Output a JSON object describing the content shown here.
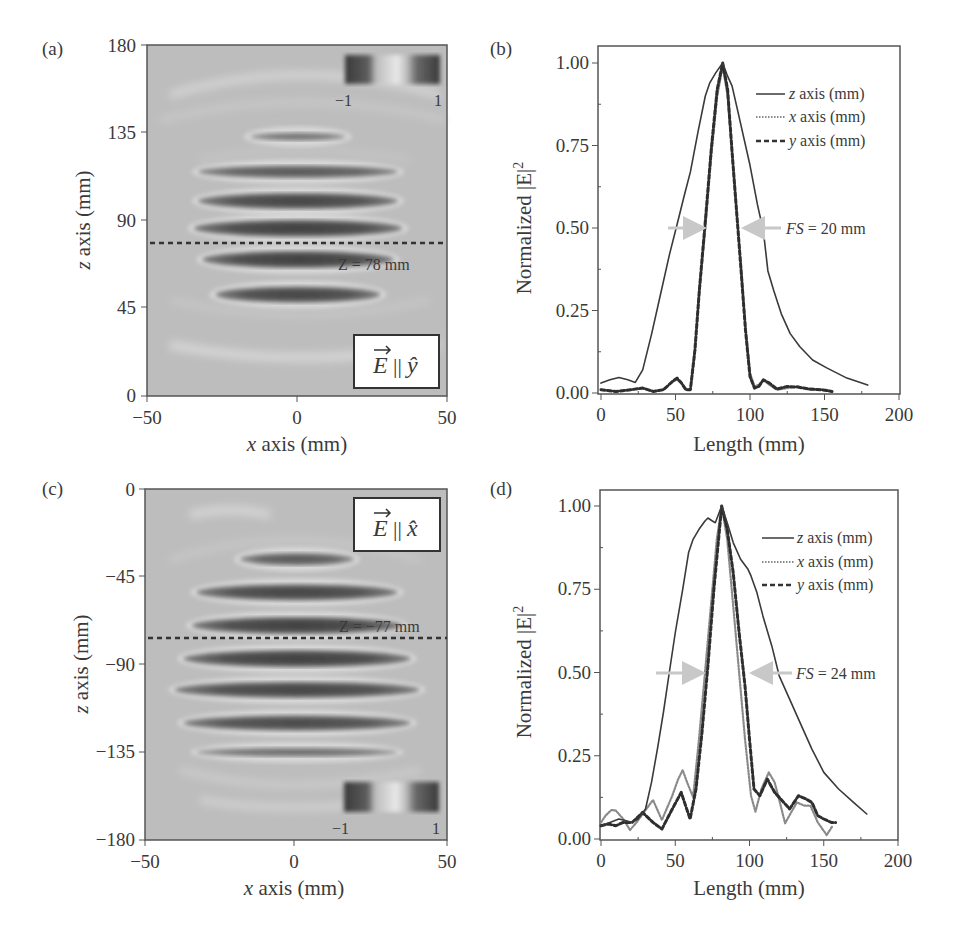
{
  "figure": {
    "panels": {
      "a": {
        "tag": "(a)",
        "xlabel_var": "x",
        "xlabel_rest": " axis (mm)",
        "ylabel_var": "z",
        "ylabel_rest": " axis (mm)",
        "xticks": [
          "−50",
          "0",
          "50"
        ],
        "yticks": [
          "0",
          "45",
          "90",
          "135",
          "180"
        ],
        "colorbar": {
          "min_label": "−1",
          "max_label": "1"
        },
        "cut_label": "Z = 78 mm",
        "polarization_label": {
          "vector": "E",
          "sep": "||",
          "unit": "ŷ"
        }
      },
      "b": {
        "tag": "(b)",
        "xlabel": "Length (mm)",
        "ylabel": "Normalized |E|",
        "ylabel_sup": "2",
        "xticks": [
          "0",
          "50",
          "100",
          "150",
          "200"
        ],
        "yticks": [
          "0.00",
          "0.25",
          "0.50",
          "0.75",
          "1.00"
        ],
        "legend": [
          {
            "var": "z",
            "rest": " axis (mm)",
            "style": "solid"
          },
          {
            "var": "x",
            "rest": " axis (mm)",
            "style": "dotted"
          },
          {
            "var": "y",
            "rest": " axis (mm)",
            "style": "dashed"
          }
        ],
        "fs_label_var": "FS",
        "fs_label_rest": " = 20 mm"
      },
      "c": {
        "tag": "(c)",
        "xlabel_var": "x",
        "xlabel_rest": " axis (mm)",
        "ylabel_var": "z",
        "ylabel_rest": " axis (mm)",
        "xticks": [
          "−50",
          "0",
          "50"
        ],
        "yticks": [
          "−180",
          "−135",
          "−90",
          "−45",
          "0"
        ],
        "colorbar": {
          "min_label": "−1",
          "max_label": "1"
        },
        "cut_label": "Z = −77 mm",
        "polarization_label": {
          "vector": "E",
          "sep": "||",
          "unit": "x̂"
        }
      },
      "d": {
        "tag": "(d)",
        "xlabel": "Length (mm)",
        "ylabel": "Normalized |E|",
        "ylabel_sup": "2",
        "xticks": [
          "0",
          "50",
          "100",
          "150",
          "200"
        ],
        "yticks": [
          "0.00",
          "0.25",
          "0.50",
          "0.75",
          "1.00"
        ],
        "legend": [
          {
            "var": "z",
            "rest": " axis (mm)",
            "style": "solid"
          },
          {
            "var": "x",
            "rest": " axis (mm)",
            "style": "dotted"
          },
          {
            "var": "y",
            "rest": " axis (mm)",
            "style": "dashed"
          }
        ],
        "fs_label_var": "FS",
        "fs_label_rest": " = 24 mm"
      }
    },
    "colors": {
      "line": "#3a3a3a",
      "dotted": "#8a8a8a",
      "arrow": "#c8c8c8",
      "field_bg": "#bdbdbd",
      "frame": "#555555"
    }
  },
  "chart_data": [
    {
      "panel": "a",
      "type": "heatmap",
      "title": "",
      "xlabel": "x axis (mm)",
      "ylabel": "z axis (mm)",
      "xlim": [
        -50,
        50
      ],
      "ylim": [
        0,
        180
      ],
      "xticks": [
        -50,
        0,
        50
      ],
      "yticks": [
        0,
        45,
        90,
        135,
        180
      ],
      "colorbar_range": [
        -1,
        1
      ],
      "annotation": "Z = 78 mm (dashed cut line)",
      "cut_z": 78,
      "polarization": "E || y-hat",
      "lobes": [
        {
          "z": 133,
          "width_mm": 11,
          "intensity": 0.45
        },
        {
          "z": 115,
          "width_mm": 23,
          "intensity": 0.7
        },
        {
          "z": 100,
          "width_mm": 23,
          "intensity": 0.9
        },
        {
          "z": 86,
          "width_mm": 24,
          "intensity": 0.95
        },
        {
          "z": 70,
          "width_mm": 22,
          "intensity": 0.95
        },
        {
          "z": 52,
          "width_mm": 19,
          "intensity": 0.9
        }
      ]
    },
    {
      "panel": "b",
      "type": "line",
      "title": "",
      "xlabel": "Length (mm)",
      "ylabel": "Normalized |E|^2",
      "xlim": [
        0,
        200
      ],
      "ylim": [
        0,
        1.05
      ],
      "xticks": [
        0,
        50,
        100,
        150,
        200
      ],
      "yticks": [
        0,
        0.25,
        0.5,
        0.75,
        1.0
      ],
      "legend_position": "upper right",
      "annotation": "FS = 20 mm",
      "arrows_y": 0.5,
      "series": [
        {
          "name": "z axis (mm)",
          "style": "solid",
          "x": [
            0,
            6,
            12,
            18,
            23,
            28,
            34,
            40,
            46,
            51,
            56,
            60,
            65,
            70,
            73,
            77,
            81.7,
            85,
            88,
            93,
            100,
            105,
            109,
            112,
            116,
            121,
            127,
            133.5,
            142,
            151.5,
            165,
            179
          ],
          "y": [
            0.03,
            0.04,
            0.047,
            0.04,
            0.032,
            0.07,
            0.18,
            0.3,
            0.42,
            0.51,
            0.6,
            0.67,
            0.79,
            0.9,
            0.94,
            0.97,
            1.0,
            0.96,
            0.93,
            0.83,
            0.69,
            0.57,
            0.49,
            0.37,
            0.31,
            0.24,
            0.18,
            0.14,
            0.1,
            0.076,
            0.045,
            0.024
          ]
        },
        {
          "name": "x axis (mm)",
          "style": "dotted",
          "x": [
            0,
            10,
            20,
            28,
            35,
            42,
            48,
            51,
            54,
            57,
            60,
            63,
            66,
            70,
            74,
            78,
            81.7,
            85,
            88,
            91,
            94,
            97,
            100,
            103,
            106,
            109,
            113,
            118,
            125,
            132,
            140,
            148,
            155
          ],
          "y": [
            0.01,
            0.005,
            0.01,
            0.015,
            0.005,
            0.01,
            0.035,
            0.04,
            0.03,
            0.01,
            0.01,
            0.12,
            0.3,
            0.5,
            0.72,
            0.9,
            0.99,
            0.9,
            0.72,
            0.55,
            0.38,
            0.2,
            0.06,
            0.02,
            0.025,
            0.04,
            0.025,
            0.01,
            0.015,
            0.02,
            0.01,
            0.01,
            0.005
          ]
        },
        {
          "name": "y axis (mm)",
          "style": "dashed",
          "x": [
            0,
            10,
            20,
            28,
            35,
            42,
            48,
            51,
            54,
            57,
            60,
            63,
            66,
            70,
            74,
            78,
            81.7,
            85,
            88,
            91,
            94,
            97,
            100,
            103,
            106,
            109,
            113,
            118,
            125,
            132,
            140,
            148,
            155
          ],
          "y": [
            0.01,
            0.005,
            0.01,
            0.015,
            0.005,
            0.01,
            0.035,
            0.045,
            0.03,
            0.01,
            0.01,
            0.13,
            0.31,
            0.52,
            0.74,
            0.92,
            1.0,
            0.92,
            0.73,
            0.55,
            0.37,
            0.19,
            0.05,
            0.015,
            0.02,
            0.04,
            0.03,
            0.012,
            0.02,
            0.018,
            0.012,
            0.01,
            0.005
          ]
        }
      ]
    },
    {
      "panel": "c",
      "type": "heatmap",
      "title": "",
      "xlabel": "x axis (mm)",
      "ylabel": "z axis (mm)",
      "xlim": [
        -50,
        50
      ],
      "ylim": [
        -180,
        0
      ],
      "xticks": [
        -50,
        0,
        50
      ],
      "yticks": [
        -180,
        -135,
        -90,
        -45,
        0
      ],
      "colorbar_range": [
        -1,
        1
      ],
      "annotation": "Z = -77 mm (dashed cut line)",
      "cut_z": -77,
      "polarization": "E || x-hat",
      "lobes": [
        {
          "z": -36,
          "width_mm": 13,
          "intensity": 0.7
        },
        {
          "z": -53,
          "width_mm": 23,
          "intensity": 0.9
        },
        {
          "z": -70,
          "width_mm": 24,
          "intensity": 0.95
        },
        {
          "z": -87,
          "width_mm": 26,
          "intensity": 0.95
        },
        {
          "z": -103,
          "width_mm": 28,
          "intensity": 0.9
        },
        {
          "z": -120,
          "width_mm": 26,
          "intensity": 0.85
        },
        {
          "z": -135,
          "width_mm": 23,
          "intensity": 0.5
        }
      ]
    },
    {
      "panel": "d",
      "type": "line",
      "title": "",
      "xlabel": "Length (mm)",
      "ylabel": "Normalized |E|^2",
      "xlim": [
        0,
        200
      ],
      "ylim": [
        0,
        1.05
      ],
      "xticks": [
        0,
        50,
        100,
        150,
        200
      ],
      "yticks": [
        0,
        0.25,
        0.5,
        0.75,
        1.0
      ],
      "legend_position": "upper right",
      "annotation": "FS = 24 mm",
      "arrows_y": 0.5,
      "series": [
        {
          "name": "z axis (mm)",
          "style": "solid",
          "x": [
            0,
            6,
            12,
            17,
            21,
            25,
            30,
            34,
            38,
            42,
            46,
            50,
            55,
            59,
            62,
            66,
            70,
            72,
            75,
            77,
            81.3,
            85,
            89,
            94,
            99,
            101,
            105,
            109,
            115,
            120,
            127,
            135,
            142,
            150,
            160,
            170,
            179
          ],
          "y": [
            0.04,
            0.05,
            0.06,
            0.055,
            0.05,
            0.06,
            0.09,
            0.17,
            0.27,
            0.38,
            0.5,
            0.62,
            0.75,
            0.86,
            0.9,
            0.93,
            0.955,
            0.964,
            0.955,
            0.95,
            1.0,
            0.95,
            0.89,
            0.84,
            0.81,
            0.79,
            0.74,
            0.67,
            0.58,
            0.49,
            0.42,
            0.34,
            0.27,
            0.2,
            0.15,
            0.11,
            0.075
          ]
        },
        {
          "name": "x axis (mm)",
          "style": "dotted",
          "x": [
            0,
            3,
            7,
            10,
            15,
            19.5,
            24,
            28,
            35,
            41,
            48,
            52,
            55,
            58,
            62,
            66,
            70,
            74,
            78,
            81.3,
            85,
            89,
            93,
            97,
            101,
            104,
            108,
            113,
            117,
            121,
            124,
            128,
            132,
            137,
            141,
            146,
            152,
            156
          ],
          "y": [
            0.05,
            0.07,
            0.087,
            0.085,
            0.06,
            0.027,
            0.05,
            0.075,
            0.117,
            0.057,
            0.13,
            0.18,
            0.207,
            0.17,
            0.126,
            0.3,
            0.5,
            0.7,
            0.9,
            1.0,
            0.9,
            0.7,
            0.5,
            0.3,
            0.13,
            0.082,
            0.15,
            0.2,
            0.17,
            0.1,
            0.047,
            0.08,
            0.11,
            0.1,
            0.1,
            0.05,
            0.012,
            0.04
          ]
        },
        {
          "name": "y axis (mm)",
          "style": "dashed",
          "x": [
            0,
            5,
            10,
            15,
            21,
            28,
            35,
            41,
            48,
            54,
            57,
            60,
            64,
            68,
            72,
            76,
            81.3,
            85,
            89,
            93,
            97,
            100,
            103,
            107,
            112,
            117,
            121,
            127,
            133,
            138,
            142,
            146,
            150,
            155,
            158
          ],
          "y": [
            0.04,
            0.045,
            0.04,
            0.05,
            0.05,
            0.08,
            0.05,
            0.03,
            0.09,
            0.14,
            0.1,
            0.06,
            0.15,
            0.32,
            0.52,
            0.75,
            1.0,
            0.93,
            0.8,
            0.62,
            0.46,
            0.3,
            0.15,
            0.13,
            0.18,
            0.14,
            0.12,
            0.09,
            0.13,
            0.12,
            0.11,
            0.07,
            0.06,
            0.05,
            0.05
          ]
        }
      ]
    }
  ]
}
